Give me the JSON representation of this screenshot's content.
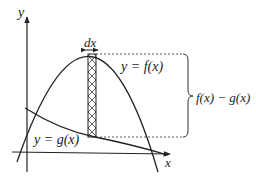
{
  "diagram": {
    "axes": {
      "x_label": "x",
      "y_label": "y"
    },
    "curves": [
      {
        "name": "f",
        "label": "y = f(x)",
        "shape": "downward parabola"
      },
      {
        "name": "g",
        "label": "y = g(x)",
        "shape": "decreasing curve"
      }
    ],
    "strip": {
      "width_label": "dx",
      "pattern": "crosshatch"
    },
    "brace": {
      "label": "f(x) − g(x)"
    },
    "colors": {
      "stroke": "#222222",
      "background": "#ffffff"
    }
  }
}
